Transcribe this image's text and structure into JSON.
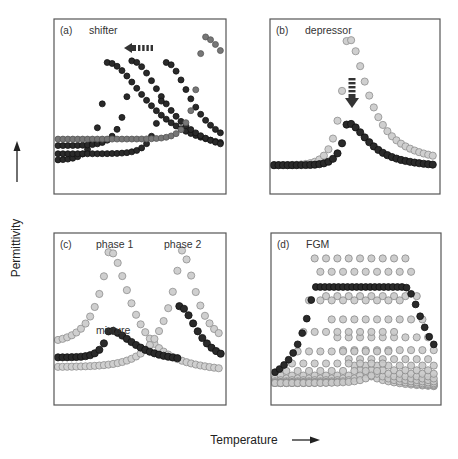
{
  "figure": {
    "ylabel": "Permittivity",
    "xlabel": "Temperature"
  },
  "chart_data": [
    {
      "id": "a",
      "type": "scatter",
      "label": "(a)",
      "title": "shifter",
      "xlabel": "Temperature",
      "ylabel": "Permittivity",
      "box": [
        54,
        19,
        226,
        194
      ],
      "annotation": {
        "type": "arrow-left-dashed",
        "text": "",
        "x": 140,
        "y": 48
      },
      "series": [
        {
          "name": "Tc1 (lowest)",
          "color": "#2a2a2a",
          "stroke": "#111111",
          "peak_x": 0.3,
          "peak_y": 0.77,
          "base_y": 0.17,
          "tail_y": 0.19,
          "rise": 0.12,
          "fall": 0.55,
          "r": 3
        },
        {
          "name": "Tc2",
          "color": "#2a2a2a",
          "stroke": "#111111",
          "peak_x": 0.45,
          "peak_y": 0.78,
          "base_y": 0.26,
          "tail_y": 0.17,
          "rise": 0.12,
          "fall": 0.45,
          "r": 3
        },
        {
          "name": "Tc3",
          "color": "#2a2a2a",
          "stroke": "#111111",
          "peak_x": 0.66,
          "peak_y": 0.77,
          "base_y": 0.21,
          "tail_y": 0.2,
          "rise": 0.12,
          "fall": 0.35,
          "r": 3
        },
        {
          "name": "Tc4 (original)",
          "color": "#777777",
          "stroke": "#555555",
          "peak_x": 0.88,
          "peak_y": 0.93,
          "base_y": 0.3,
          "tail_y": 0.33,
          "rise": 0.12,
          "fall": 0.5,
          "r": 3
        }
      ]
    },
    {
      "id": "b",
      "type": "scatter",
      "label": "(b)",
      "title": "depressor",
      "xlabel": "Temperature",
      "ylabel": "Permittivity",
      "box": [
        270,
        19,
        440,
        194
      ],
      "annotation": {
        "type": "arrow-down-dashed",
        "text": "",
        "x": 352,
        "y": 90
      },
      "series": [
        {
          "name": "pure",
          "color": "#cfcfcf",
          "stroke": "#8f8f8f",
          "peak_x": 0.45,
          "peak_y": 0.93,
          "base_y": 0.14,
          "tail_y": 0.14,
          "rise": 0.12,
          "fall": 0.28,
          "r": 3.6
        },
        {
          "name": "depressed",
          "color": "#2a2a2a",
          "stroke": "#111111",
          "peak_x": 0.45,
          "peak_y": 0.4,
          "base_y": 0.14,
          "tail_y": 0.12,
          "rise": 0.1,
          "fall": 0.3,
          "r": 3.6
        }
      ]
    },
    {
      "id": "c",
      "type": "scatter",
      "label": "(c)",
      "title": "",
      "annotations": [
        "phase 1",
        "phase 2",
        "mixture"
      ],
      "xlabel": "Temperature",
      "ylabel": "Permittivity",
      "box": [
        54,
        233,
        226,
        405
      ],
      "series": [
        {
          "name": "phase 1",
          "color": "#cfcfcf",
          "stroke": "#8f8f8f",
          "peak_x": 0.31,
          "peak_y": 0.93,
          "base_y": 0.35,
          "tail_y": 0.15,
          "rise": 0.2,
          "fall": 0.3,
          "r": 3.6,
          "x_end": 1.0
        },
        {
          "name": "phase 2",
          "color": "#cfcfcf",
          "stroke": "#8f8f8f",
          "peak_x": 0.75,
          "peak_y": 0.93,
          "base_y": 0.2,
          "tail_y": 0.3,
          "rise": 0.25,
          "fall": 0.2,
          "r": 3.6,
          "x_start": 0.0
        },
        {
          "name": "mixture (phase 1 part)",
          "color": "#2a2a2a",
          "stroke": "#111111",
          "peak_x": 0.31,
          "peak_y": 0.43,
          "base_y": 0.26,
          "tail_y": 0.22,
          "rise": 0.1,
          "fall": 0.35,
          "r": 3.6,
          "x_end": 0.74
        },
        {
          "name": "mixture (phase 2 part)",
          "color": "#2a2a2a",
          "stroke": "#111111",
          "peak_x": 0.74,
          "peak_y": 0.58,
          "base_y": 0.26,
          "tail_y": 0.2,
          "rise": 0.02,
          "fall": 0.25,
          "r": 3.6,
          "x_start": 0.74
        }
      ]
    },
    {
      "id": "d",
      "type": "scatter",
      "label": "(d)",
      "title": "FGM",
      "xlabel": "Temperature",
      "ylabel": "Permittivity",
      "box": [
        271,
        233,
        441,
        405
      ],
      "layers": {
        "count": 9,
        "first_peak_x": 0.24,
        "last_peak_x": 0.8,
        "peak_y": 0.88,
        "base_y": 0.1,
        "color": "#c8c8c8",
        "stroke": "#8a8a8a"
      },
      "series": [
        {
          "name": "FGM composite",
          "color": "#2a2a2a",
          "stroke": "#111111",
          "plateau_start": 0.24,
          "plateau_end": 0.8,
          "plateau_y": 0.7,
          "base_y": 0.1,
          "tail_y": 0.12,
          "r": 3.4
        }
      ]
    }
  ]
}
